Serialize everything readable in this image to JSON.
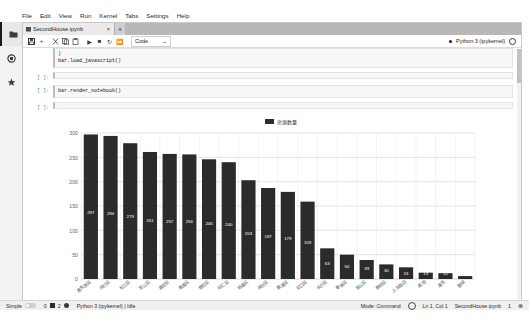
{
  "app": {
    "logo_name": "jupyterlab-logo"
  },
  "menubar": {
    "items": [
      {
        "label": "File"
      },
      {
        "label": "Edit"
      },
      {
        "label": "View"
      },
      {
        "label": "Run"
      },
      {
        "label": "Kernel"
      },
      {
        "label": "Tabs"
      },
      {
        "label": "Settings"
      },
      {
        "label": "Help"
      }
    ]
  },
  "activitybar": {
    "items": [
      {
        "name": "file-browser-icon",
        "glyph": "▮"
      },
      {
        "name": "running-terminals-icon",
        "glyph": "●"
      },
      {
        "name": "extension-manager-icon",
        "glyph": "✦"
      }
    ]
  },
  "tabbar": {
    "tabs": [
      {
        "label": "SecondHouse.ipynb",
        "close": "×",
        "icon": "notebook-icon"
      }
    ],
    "add_label": "+"
  },
  "toolbar": {
    "buttons": [
      {
        "name": "save-button",
        "glyph": "▤"
      },
      {
        "name": "insert-cell-button",
        "glyph": "+"
      },
      {
        "name": "cut-button",
        "glyph": "✂"
      },
      {
        "name": "copy-button",
        "glyph": "❐"
      },
      {
        "name": "paste-button",
        "glyph": "❑"
      },
      {
        "name": "run-button",
        "glyph": "▶"
      },
      {
        "name": "stop-button",
        "glyph": "■"
      },
      {
        "name": "restart-button",
        "glyph": "↻"
      },
      {
        "name": "restart-run-all-button",
        "glyph": "⏩"
      }
    ],
    "celltype_value": "Code",
    "celltype_caret": "⌄",
    "kernel_name": "Python 3 (ipykernel)"
  },
  "notebook": {
    "cells": [
      {
        "prompt": "",
        "lines": [
          ")",
          "bar.load_javascript()"
        ],
        "type": "code-continuation"
      },
      {
        "prompt": "[ ]:",
        "lines": [
          ""
        ],
        "type": "code-empty"
      },
      {
        "prompt": "[ ]:",
        "lines": [
          "bar.render_notebook()"
        ],
        "type": "code"
      },
      {
        "prompt": "[ ]:",
        "lines": [
          ""
        ],
        "type": "code-empty"
      }
    ]
  },
  "statusbar": {
    "simple_label": "Simple",
    "kernel_count": "0",
    "terminal_count": "2",
    "kernel_status": "Python 3 (ipykernel) | Idle",
    "mode": "Mode: Command",
    "cursor": "Ln 1, Col 1",
    "filename": "SecondHouse.ipynb",
    "notification_count": "1",
    "bell": "⊗"
  },
  "chart_data": {
    "type": "bar",
    "title": "",
    "legend": [
      "房源数量"
    ],
    "legend_position": "top-center",
    "xlabel": "",
    "ylabel": "",
    "ylim": [
      0,
      300
    ],
    "yticks": [
      0,
      50,
      100,
      150,
      200,
      250,
      300
    ],
    "grid": true,
    "bar_color": "#2b2b2b",
    "categories": [
      "浦东新区",
      "闵行区",
      "松江区",
      "宝山区",
      "嘉定区",
      "青浦区",
      "普陀区",
      "徐汇区",
      "杨浦区",
      "闸北区",
      "黄浦区",
      "虹口区",
      "长宁区",
      "奉贤区",
      "金山区",
      "崇明区",
      "上海周边",
      "其他",
      "浦东",
      "静安"
    ],
    "values": [
      297,
      294,
      279,
      261,
      257,
      256,
      246,
      240,
      203,
      187,
      179,
      159,
      63,
      50,
      39,
      30,
      24,
      13,
      12,
      6
    ],
    "labels": [
      "297",
      "294",
      "279",
      "261",
      "257",
      "256",
      "246",
      "240",
      "203",
      "187",
      "179",
      "159",
      "63",
      "50",
      "39",
      "30",
      "24",
      "13",
      "12",
      "6"
    ]
  }
}
